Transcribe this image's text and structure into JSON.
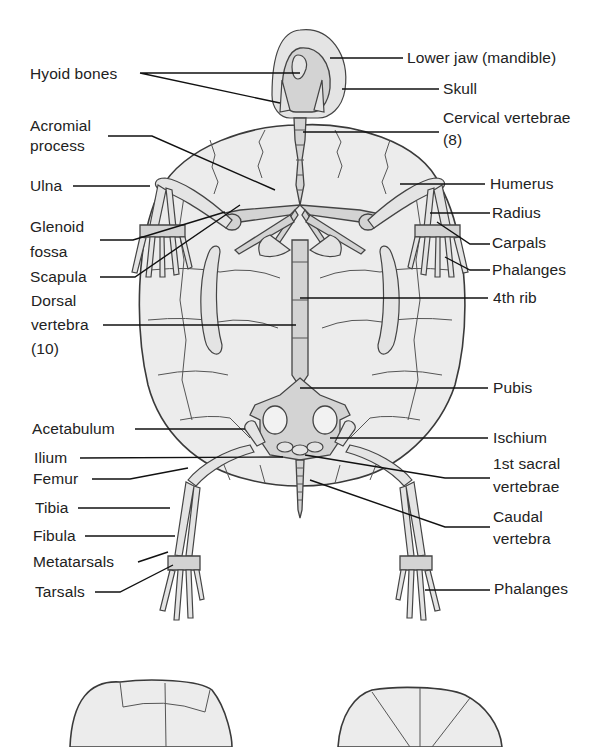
{
  "figure": {
    "colors": {
      "shell": "#ececec",
      "bone": "#d3d3d3",
      "line": "#3a3a3a",
      "text": "#222222"
    }
  },
  "labels": {
    "left": [
      {
        "id": "hyoid",
        "text": "Hyoid bones"
      },
      {
        "id": "acromial1",
        "text": "Acromial"
      },
      {
        "id": "acromial2",
        "text": "process"
      },
      {
        "id": "ulna",
        "text": "Ulna"
      },
      {
        "id": "glenoid1",
        "text": "Glenoid"
      },
      {
        "id": "glenoid2",
        "text": "fossa"
      },
      {
        "id": "scapula",
        "text": "Scapula"
      },
      {
        "id": "dorsal1",
        "text": "Dorsal"
      },
      {
        "id": "dorsal2",
        "text": "vertebra"
      },
      {
        "id": "dorsal3",
        "text": "(10)"
      },
      {
        "id": "acetabulum",
        "text": "Acetabulum"
      },
      {
        "id": "ilium",
        "text": "Ilium"
      },
      {
        "id": "femur",
        "text": "Femur"
      },
      {
        "id": "tibia",
        "text": "Tibia"
      },
      {
        "id": "fibula",
        "text": "Fibula"
      },
      {
        "id": "metatarsals",
        "text": "Metatarsals"
      },
      {
        "id": "tarsals",
        "text": "Tarsals"
      }
    ],
    "right": [
      {
        "id": "lowerjaw",
        "text": "Lower jaw (mandible)"
      },
      {
        "id": "skull",
        "text": "Skull"
      },
      {
        "id": "cervical1",
        "text": "Cervical vertebrae"
      },
      {
        "id": "cervical2",
        "text": "(8)"
      },
      {
        "id": "humerus",
        "text": "Humerus"
      },
      {
        "id": "radius",
        "text": "Radius"
      },
      {
        "id": "carpals",
        "text": "Carpals"
      },
      {
        "id": "phalanges_fore",
        "text": "Phalanges"
      },
      {
        "id": "rib4",
        "text": "4th rib"
      },
      {
        "id": "pubis",
        "text": "Pubis"
      },
      {
        "id": "ischium",
        "text": "Ischium"
      },
      {
        "id": "sacral1",
        "text": "1st sacral"
      },
      {
        "id": "sacral2",
        "text": "vertebrae"
      },
      {
        "id": "caudal1",
        "text": "Caudal"
      },
      {
        "id": "caudal2",
        "text": "vertebra"
      },
      {
        "id": "phalanges_hind",
        "text": "Phalanges"
      }
    ]
  }
}
